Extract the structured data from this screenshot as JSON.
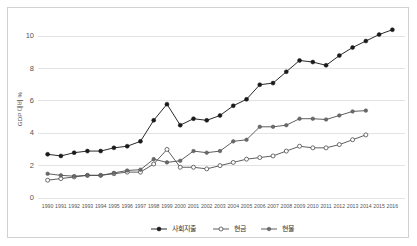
{
  "chart_data": {
    "type": "line",
    "title": "",
    "xlabel": "",
    "ylabel": "GDP 대비 %",
    "ylim": [
      0,
      11
    ],
    "yticks": [
      0,
      2,
      4,
      6,
      8,
      10
    ],
    "grid": true,
    "legend_position": "bottom",
    "categories": [
      "1990",
      "1991",
      "1992",
      "1993",
      "1994",
      "1995",
      "1996",
      "1997",
      "1998",
      "1999",
      "2000",
      "2001",
      "2002",
      "2003",
      "2004",
      "2005",
      "2006",
      "2007",
      "2008",
      "2009",
      "2010",
      "2011",
      "2012",
      "2013",
      "2014",
      "2015",
      "2016"
    ],
    "series": [
      {
        "name": "사회지출",
        "marker": "filled-circle-dark",
        "values": [
          2.7,
          2.6,
          2.8,
          2.9,
          2.9,
          3.1,
          3.2,
          3.5,
          4.8,
          5.8,
          4.5,
          4.9,
          4.8,
          5.1,
          5.7,
          6.1,
          7.0,
          7.1,
          7.8,
          8.5,
          8.4,
          8.2,
          8.8,
          9.3,
          9.7,
          10.1,
          10.4
        ]
      },
      {
        "name": "현금",
        "marker": "open-circle",
        "values": [
          1.1,
          1.2,
          1.3,
          1.4,
          1.4,
          1.5,
          1.6,
          1.6,
          2.1,
          3.0,
          1.9,
          1.9,
          1.8,
          2.0,
          2.2,
          2.4,
          2.5,
          2.6,
          2.9,
          3.2,
          3.1,
          3.1,
          3.3,
          3.6,
          3.9,
          null,
          null
        ]
      },
      {
        "name": "현물",
        "marker": "filled-circle-gray",
        "values": [
          1.5,
          1.4,
          1.35,
          1.4,
          1.4,
          1.55,
          1.7,
          1.75,
          2.4,
          2.2,
          2.3,
          2.9,
          2.8,
          2.9,
          3.5,
          3.6,
          4.4,
          4.4,
          4.5,
          4.9,
          4.9,
          4.85,
          5.1,
          5.35,
          5.4,
          null,
          null
        ]
      }
    ]
  }
}
